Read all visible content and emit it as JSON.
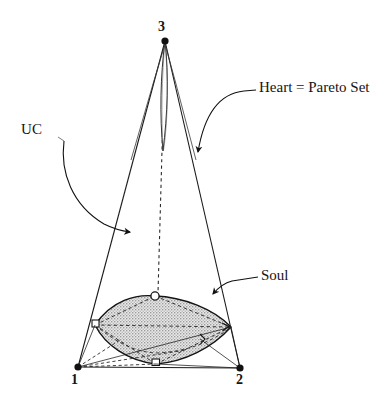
{
  "figure": {
    "vertices": [
      {
        "id": "v1",
        "label": "1",
        "x": 78,
        "y": 367
      },
      {
        "id": "v2",
        "label": "2",
        "x": 240,
        "y": 368
      },
      {
        "id": "v3",
        "label": "3",
        "x": 165,
        "y": 40
      }
    ],
    "callouts": [
      {
        "id": "uc",
        "label": "UC"
      },
      {
        "id": "heart",
        "label": "Heart = Pareto Set"
      },
      {
        "id": "soul",
        "label": "Soul"
      }
    ],
    "colors": {
      "stroke": "#1a1a1a",
      "soul_fill": "#c9c9c9",
      "soul_fill_light": "#d8d8d8",
      "dash_stroke": "#2b2b2b",
      "background": "#ffffff"
    },
    "regions": {
      "heart": {
        "name": "Heart = Pareto Set",
        "description": "narrow vertical lens from apex 3 downward",
        "apex_x": 165,
        "apex_y": 41,
        "bottom_y": 152,
        "max_half_width": 5
      },
      "soul": {
        "name": "Soul",
        "description": "shaded lens-shaped region near the base of the cone",
        "left_x": 95,
        "left_y": 325,
        "right_x": 231,
        "right_y": 327,
        "top_x": 155,
        "top_y": 296,
        "bottom_x": 156,
        "bottom_y": 364
      }
    }
  }
}
